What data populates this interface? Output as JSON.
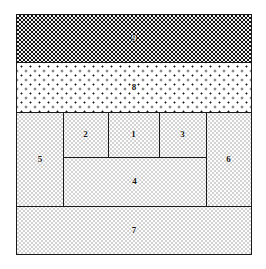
{
  "figure": {
    "title": "",
    "type": "partition-diagram",
    "frame": {
      "x": 16,
      "y": 14,
      "width": 236,
      "height": 241,
      "border_color": "#1a1a1a"
    },
    "fills": {
      "dark_checkerboard": "#2b2b2b",
      "white_dotted": "#ffffff",
      "light_stipple": "#fbfbfb",
      "line_color": "#1a1a1a"
    },
    "regions": [
      {
        "id": "9",
        "label": "9",
        "fill": "dark-check",
        "label_color": "#ffffff",
        "x": 0,
        "y": 0,
        "width": 234,
        "height": 47
      },
      {
        "id": "8",
        "label": "8",
        "fill": "dots",
        "label_color": "#111111",
        "x": 0,
        "y": 47,
        "width": 234,
        "height": 50
      },
      {
        "id": "5",
        "label": "5",
        "fill": "stipple",
        "label_color": "#111111",
        "x": 0,
        "y": 97,
        "width": 46,
        "height": 94
      },
      {
        "id": "2",
        "label": "2",
        "fill": "stipple",
        "label_color": "#111111",
        "x": 46,
        "y": 97,
        "width": 45,
        "height": 45
      },
      {
        "id": "1",
        "label": "1",
        "fill": "stipple",
        "label_color": "#111111",
        "x": 91,
        "y": 97,
        "width": 51,
        "height": 45
      },
      {
        "id": "3",
        "label": "3",
        "fill": "stipple",
        "label_color": "#111111",
        "x": 142,
        "y": 97,
        "width": 47,
        "height": 45
      },
      {
        "id": "4",
        "label": "4",
        "fill": "stipple",
        "label_color": "#111111",
        "x": 46,
        "y": 142,
        "width": 143,
        "height": 49
      },
      {
        "id": "6",
        "label": "6",
        "fill": "stipple",
        "label_color": "#111111",
        "x": 189,
        "y": 97,
        "width": 45,
        "height": 94
      },
      {
        "id": "7",
        "label": "7",
        "fill": "stipple",
        "label_color": "#111111",
        "x": 0,
        "y": 191,
        "width": 234,
        "height": 48
      }
    ],
    "dividers": [
      {
        "orientation": "horizontal",
        "x": 0,
        "y": 47,
        "length": 234
      },
      {
        "orientation": "horizontal",
        "x": 0,
        "y": 97,
        "length": 234
      },
      {
        "orientation": "horizontal",
        "x": 46,
        "y": 142,
        "length": 143
      },
      {
        "orientation": "horizontal",
        "x": 0,
        "y": 191,
        "length": 234
      },
      {
        "orientation": "vertical",
        "x": 46,
        "y": 97,
        "length": 94
      },
      {
        "orientation": "vertical",
        "x": 91,
        "y": 97,
        "length": 45
      },
      {
        "orientation": "vertical",
        "x": 142,
        "y": 97,
        "length": 45
      },
      {
        "orientation": "vertical",
        "x": 189,
        "y": 97,
        "length": 94
      }
    ]
  }
}
